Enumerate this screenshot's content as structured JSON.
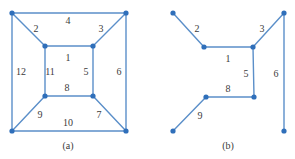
{
  "figure": {
    "background_color": "#ffffff",
    "edge_color": "#5b8fc9",
    "vertex_color": "#2f6fba",
    "label_color": "#3b3b3b",
    "width": 295,
    "height": 159
  },
  "panels": [
    {
      "id": "panel-a",
      "caption": "(a)",
      "caption_pos": {
        "x": 68,
        "y": 146
      },
      "vertices": [
        {
          "name": "outer-top-left",
          "x": 12,
          "y": 13
        },
        {
          "name": "outer-top-right",
          "x": 126,
          "y": 13
        },
        {
          "name": "outer-bottom-left",
          "x": 12,
          "y": 131
        },
        {
          "name": "outer-bottom-right",
          "x": 126,
          "y": 131
        },
        {
          "name": "inner-top-left",
          "x": 45,
          "y": 46
        },
        {
          "name": "inner-top-right",
          "x": 93,
          "y": 46
        },
        {
          "name": "inner-bottom-left",
          "x": 45,
          "y": 96
        },
        {
          "name": "inner-bottom-right",
          "x": 93,
          "y": 96
        }
      ],
      "edges": [
        {
          "label": "4",
          "x1": 12,
          "y1": 13,
          "x2": 126,
          "y2": 13
        },
        {
          "label": "12",
          "x1": 12,
          "y1": 13,
          "x2": 12,
          "y2": 131
        },
        {
          "label": "6",
          "x1": 126,
          "y1": 13,
          "x2": 126,
          "y2": 131
        },
        {
          "label": "10",
          "x1": 12,
          "y1": 131,
          "x2": 126,
          "y2": 131
        },
        {
          "label": "2",
          "x1": 12,
          "y1": 13,
          "x2": 45,
          "y2": 46
        },
        {
          "label": "3",
          "x1": 126,
          "y1": 13,
          "x2": 93,
          "y2": 46
        },
        {
          "label": "9",
          "x1": 12,
          "y1": 131,
          "x2": 45,
          "y2": 96
        },
        {
          "label": "7",
          "x1": 126,
          "y1": 131,
          "x2": 93,
          "y2": 96
        },
        {
          "label": "1",
          "x1": 45,
          "y1": 46,
          "x2": 93,
          "y2": 46
        },
        {
          "label": "11",
          "x1": 45,
          "y1": 46,
          "x2": 45,
          "y2": 96
        },
        {
          "label": "5",
          "x1": 93,
          "y1": 46,
          "x2": 93,
          "y2": 96
        },
        {
          "label": "8",
          "x1": 45,
          "y1": 96,
          "x2": 93,
          "y2": 96
        }
      ],
      "labels": [
        {
          "text": "2",
          "x": 36,
          "y": 29
        },
        {
          "text": "4",
          "x": 68,
          "y": 21
        },
        {
          "text": "3",
          "x": 101,
          "y": 29
        },
        {
          "text": "12",
          "x": 21,
          "y": 72
        },
        {
          "text": "11",
          "x": 50,
          "y": 72
        },
        {
          "text": "1",
          "x": 68,
          "y": 58
        },
        {
          "text": "5",
          "x": 86,
          "y": 72
        },
        {
          "text": "6",
          "x": 119,
          "y": 72
        },
        {
          "text": "8",
          "x": 67,
          "y": 88
        },
        {
          "text": "9",
          "x": 40,
          "y": 115
        },
        {
          "text": "10",
          "x": 68,
          "y": 123
        },
        {
          "text": "7",
          "x": 99,
          "y": 115
        }
      ]
    },
    {
      "id": "panel-b",
      "caption": "(b)",
      "caption_pos": {
        "x": 228,
        "y": 146
      },
      "vertices": [
        {
          "name": "upper-left-endpoint",
          "x": 173,
          "y": 13
        },
        {
          "name": "upper-right-endpoint",
          "x": 284,
          "y": 13
        },
        {
          "name": "inner-top-left",
          "x": 204,
          "y": 47
        },
        {
          "name": "inner-top-right",
          "x": 253,
          "y": 47
        },
        {
          "name": "inner-bottom-left",
          "x": 206,
          "y": 97
        },
        {
          "name": "inner-bottom-right",
          "x": 254,
          "y": 97
        },
        {
          "name": "lower-left-endpoint",
          "x": 173,
          "y": 131
        },
        {
          "name": "lower-right-endpoint",
          "x": 284,
          "y": 131
        }
      ],
      "edges": [
        {
          "label": "2",
          "x1": 173,
          "y1": 13,
          "x2": 204,
          "y2": 47
        },
        {
          "label": "3",
          "x1": 284,
          "y1": 13,
          "x2": 253,
          "y2": 47
        },
        {
          "label": "6",
          "x1": 284,
          "y1": 13,
          "x2": 284,
          "y2": 131
        },
        {
          "label": "1",
          "x1": 204,
          "y1": 47,
          "x2": 253,
          "y2": 47
        },
        {
          "label": "5",
          "x1": 253,
          "y1": 47,
          "x2": 254,
          "y2": 97
        },
        {
          "label": "8",
          "x1": 206,
          "y1": 97,
          "x2": 254,
          "y2": 97
        },
        {
          "label": "9",
          "x1": 173,
          "y1": 131,
          "x2": 206,
          "y2": 97
        }
      ],
      "labels": [
        {
          "text": "2",
          "x": 197,
          "y": 29
        },
        {
          "text": "3",
          "x": 262,
          "y": 29
        },
        {
          "text": "1",
          "x": 228,
          "y": 59
        },
        {
          "text": "5",
          "x": 246,
          "y": 74
        },
        {
          "text": "6",
          "x": 276,
          "y": 74
        },
        {
          "text": "8",
          "x": 228,
          "y": 89
        },
        {
          "text": "9",
          "x": 200,
          "y": 116
        }
      ]
    }
  ]
}
